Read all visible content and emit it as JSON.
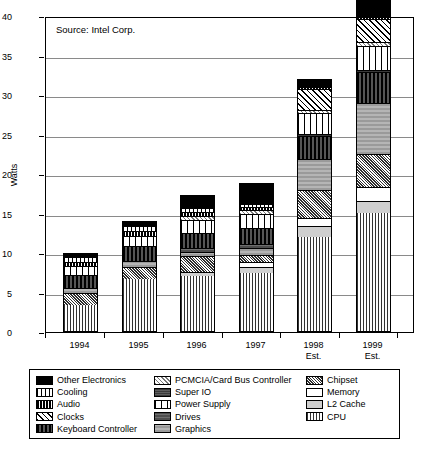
{
  "source_note": "Source: Intel Corp.",
  "axes": {
    "y_title": "Watts",
    "y_ticks": [
      "0",
      "5",
      "10",
      "15",
      "20",
      "25",
      "30",
      "35",
      "40"
    ],
    "x_labels": [
      {
        "year": "1994",
        "est": ""
      },
      {
        "year": "1995",
        "est": ""
      },
      {
        "year": "1996",
        "est": ""
      },
      {
        "year": "1997",
        "est": ""
      },
      {
        "year": "1998",
        "est": "Est."
      },
      {
        "year": "1999",
        "est": "Est."
      }
    ]
  },
  "legend": {
    "columns": [
      [
        {
          "label": "Other Electronics",
          "pattern": "solid-black"
        },
        {
          "label": "Cooling",
          "pattern": "vert-wide"
        },
        {
          "label": "Audio",
          "pattern": "audio"
        },
        {
          "label": "Clocks",
          "pattern": "diag-fine"
        },
        {
          "label": "Keyboard Controller",
          "pattern": "kbd"
        }
      ],
      [
        {
          "label": "PCMCIA/Card Bus Controller",
          "pattern": "pcmcia"
        },
        {
          "label": "Super IO",
          "pattern": "superio"
        },
        {
          "label": "Power Supply",
          "pattern": "psu"
        },
        {
          "label": "Drives",
          "pattern": "drives"
        },
        {
          "label": "Graphics",
          "pattern": "graphics"
        }
      ],
      [
        {
          "label": "Chipset",
          "pattern": "chipset"
        },
        {
          "label": "Memory",
          "pattern": "memory"
        },
        {
          "label": "L2 Cache",
          "pattern": "l2"
        },
        {
          "label": "CPU",
          "pattern": "cpu"
        }
      ]
    ]
  },
  "chart_data": {
    "type": "bar",
    "stacked": true,
    "title": "",
    "subtitle": "",
    "annotations": [
      "Source: Intel Corp."
    ],
    "xlabel": "",
    "ylabel": "Watts",
    "ylim": [
      0,
      40
    ],
    "ytick_step": 5,
    "grid": true,
    "legend_position": "bottom",
    "categories": [
      "1994",
      "1995",
      "1996",
      "1997",
      "1998 Est.",
      "1999 Est."
    ],
    "totals": [
      10.0,
      14.0,
      17.3,
      18.8,
      32.0,
      38.0
    ],
    "series": [
      {
        "name": "CPU",
        "pattern": "cpu",
        "values": [
          3.4,
          6.7,
          7.1,
          7.4,
          12.0,
          15.0
        ]
      },
      {
        "name": "L2 Cache",
        "pattern": "l2",
        "values": [
          0.0,
          0.0,
          0.5,
          0.8,
          1.4,
          1.6
        ]
      },
      {
        "name": "Memory",
        "pattern": "memory",
        "values": [
          0.0,
          0.0,
          0.0,
          0.6,
          1.0,
          1.8
        ]
      },
      {
        "name": "Chipset",
        "pattern": "chipset",
        "values": [
          1.5,
          1.6,
          2.1,
          1.0,
          3.6,
          4.2
        ]
      },
      {
        "name": "Graphics",
        "pattern": "graphics",
        "values": [
          0.7,
          0.7,
          0.5,
          0.8,
          4.0,
          6.4
        ]
      },
      {
        "name": "Drives",
        "pattern": "drives",
        "values": [
          0.0,
          0.0,
          0.5,
          0.6,
          0.0,
          0.0
        ]
      },
      {
        "name": "Keyboard Controller",
        "pattern": "kbd",
        "values": [
          1.7,
          1.9,
          1.9,
          2.0,
          2.9,
          4.0
        ]
      },
      {
        "name": "Super IO",
        "pattern": "superio",
        "values": [
          0.0,
          0.0,
          0.0,
          0.0,
          0.2,
          0.3
        ]
      },
      {
        "name": "Power Supply",
        "pattern": "psu",
        "values": [
          1.2,
          1.4,
          1.7,
          1.8,
          2.7,
          3.0
        ]
      },
      {
        "name": "PCMCIA/Card Bus Controller",
        "pattern": "pcmcia",
        "values": [
          0.0,
          0.0,
          0.5,
          0.5,
          0.4,
          0.5
        ]
      },
      {
        "name": "Clocks",
        "pattern": "diag-fine",
        "values": [
          0.0,
          0.0,
          0.0,
          0.0,
          2.7,
          2.9
        ]
      },
      {
        "name": "Audio",
        "pattern": "audio",
        "values": [
          0.5,
          0.6,
          0.5,
          0.4,
          0.2,
          0.3
        ]
      },
      {
        "name": "Cooling",
        "pattern": "vert-wide",
        "values": [
          0.6,
          0.6,
          0.5,
          0.4,
          0.0,
          0.0
        ]
      },
      {
        "name": "Other Electronics",
        "pattern": "solid-black",
        "values": [
          0.4,
          0.5,
          1.5,
          2.5,
          0.9,
          2.0
        ]
      }
    ]
  }
}
